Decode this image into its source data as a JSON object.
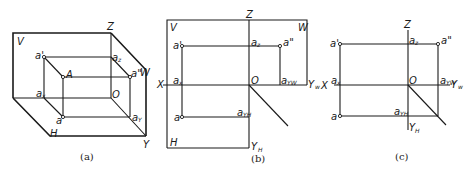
{
  "figure_a": {
    "caption": "(a)",
    "labels": {
      "V": "V",
      "Z": "Z",
      "W": "W",
      "H": "H",
      "Y": "Y",
      "A": "A",
      "O": "O",
      "a_prime": "a'",
      "a_z": "a",
      "a_z_sub": "z",
      "a_dprime": "a\"",
      "a_x": "a",
      "a_x_sub": "x",
      "a": "a",
      "a_y": "a",
      "a_y_sub": "Y"
    }
  },
  "figure_b": {
    "caption": "(b)",
    "labels": {
      "V": "V",
      "Z": "Z",
      "W": "W",
      "H": "H",
      "X": "X",
      "O": "O",
      "Y_w": "Y",
      "Y_w_sub": "w",
      "Y_h": "Y",
      "Y_h_sub": "H",
      "a_prime": "a'",
      "a_z": "a",
      "a_z_sub": "z",
      "a_dprime": "a\"",
      "a_x": "a",
      "a_x_sub": "x",
      "a_yw": "a",
      "a_yw_sub": "YW",
      "a": "a",
      "a_yh": "a",
      "a_yh_sub": "YH"
    }
  },
  "figure_c": {
    "caption": "(c)",
    "labels": {
      "Z": "Z",
      "X": "X",
      "O": "O",
      "Y_w": "Y",
      "Y_w_sub": "w",
      "Y_h": "Y",
      "Y_h_sub": "H",
      "a_prime": "a'",
      "a_z": "a",
      "a_z_sub": "z",
      "a_dprime": "a\"",
      "a_x": "a",
      "a_x_sub": "x",
      "a_yw": "a",
      "a_yw_sub": "YW",
      "a": "a",
      "a_yh": "a",
      "a_yh_sub": "YH"
    }
  }
}
